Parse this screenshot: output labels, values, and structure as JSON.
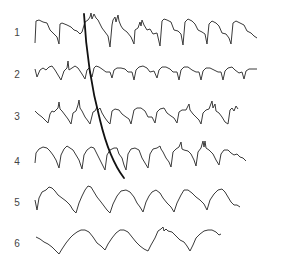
{
  "figure": {
    "traces": [
      {
        "label": "1",
        "label_y": 28
      },
      {
        "label": "2",
        "label_y": 70
      },
      {
        "label": "3",
        "label_y": 112
      },
      {
        "label": "4",
        "label_y": 157
      },
      {
        "label": "5",
        "label_y": 198
      },
      {
        "label": "6",
        "label_y": 239
      }
    ],
    "overlay_curve": "progression line crossing traces 1 through 4",
    "colors": {
      "trace": "#3a3a3a",
      "curve": "#111111",
      "background": "#ffffff"
    }
  }
}
